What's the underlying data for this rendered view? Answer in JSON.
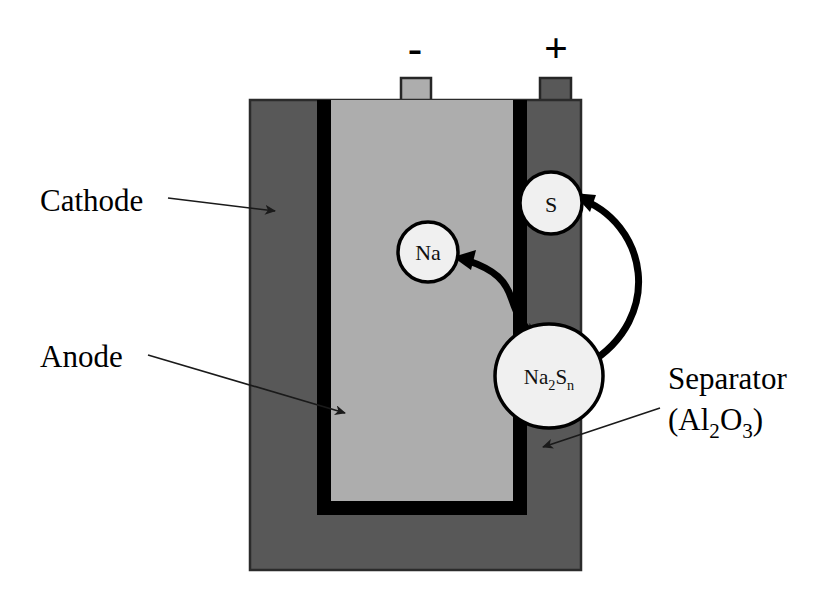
{
  "diagram": {
    "background_color": "#ffffff"
  },
  "cell": {
    "cathode": {
      "label": "Cathode",
      "color": "#585858",
      "outline_color": "#2b2b2b"
    },
    "anode": {
      "label": "Anode",
      "color": "#adadad"
    },
    "separator": {
      "label_line1": "Separator",
      "label_line2_prefix": "(Al",
      "label_line2_sub1": "2",
      "label_line2_mid": "O",
      "label_line2_sub2": "3",
      "label_line2_suffix": ")",
      "color": "#000000"
    }
  },
  "terminals": {
    "negative": {
      "symbol": "-",
      "name": "negative-terminal",
      "color": "#adadad"
    },
    "positive": {
      "symbol": "+",
      "name": "positive-terminal",
      "color": "#585858"
    }
  },
  "species": [
    {
      "id": "na",
      "label": "Na",
      "fill": "#f0f0f0",
      "stroke": "#000000"
    },
    {
      "id": "s",
      "label": "S",
      "fill": "#f0f0f0",
      "stroke": "#000000"
    },
    {
      "id": "na2sn",
      "label_prefix": "Na",
      "label_sub1": "2",
      "label_mid": "S",
      "label_sub2": "n",
      "fill": "#f0f0f0",
      "stroke": "#000000"
    }
  ],
  "reactions": [
    {
      "id": "na-to-na2sn",
      "from": "Na",
      "to": "Na2Sn",
      "style": "double-headed-curved"
    },
    {
      "id": "s-to-na2sn",
      "from": "S",
      "to": "Na2Sn",
      "style": "double-headed-curved"
    }
  ],
  "colors": {
    "cathode_gray": "#585858",
    "anode_gray": "#adadad",
    "separator_black": "#000000",
    "circle_fill": "#f0f0f0",
    "line_black": "#000000"
  }
}
